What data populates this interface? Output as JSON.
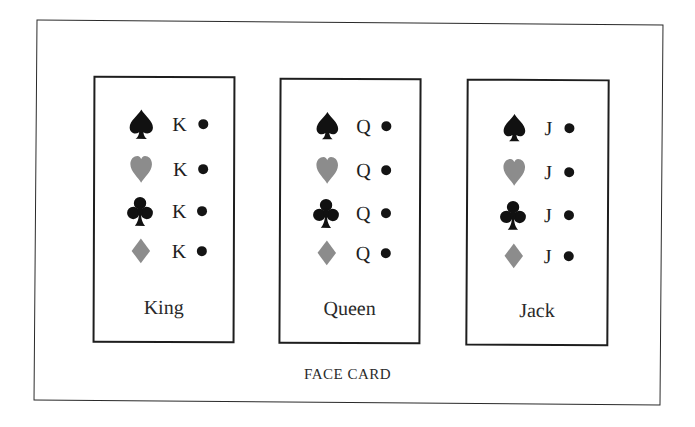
{
  "caption": "FACE CARD",
  "colors": {
    "black_suit": "#111111",
    "gray_suit": "#8c8c8c",
    "border": "#1e1e1e"
  },
  "cards": [
    {
      "name": "King",
      "rank": "K",
      "rows": [
        {
          "suit": "spade",
          "rank": "K"
        },
        {
          "suit": "heart",
          "rank": "K"
        },
        {
          "suit": "club",
          "rank": "K"
        },
        {
          "suit": "diamond",
          "rank": "K"
        }
      ]
    },
    {
      "name": "Queen",
      "rank": "Q",
      "rows": [
        {
          "suit": "spade",
          "rank": "Q"
        },
        {
          "suit": "heart",
          "rank": "Q"
        },
        {
          "suit": "club",
          "rank": "Q"
        },
        {
          "suit": "diamond",
          "rank": "Q"
        }
      ]
    },
    {
      "name": "Jack",
      "rank": "J",
      "rows": [
        {
          "suit": "spade",
          "rank": "J"
        },
        {
          "suit": "heart",
          "rank": "J"
        },
        {
          "suit": "club",
          "rank": "J"
        },
        {
          "suit": "diamond",
          "rank": "J"
        }
      ]
    }
  ]
}
